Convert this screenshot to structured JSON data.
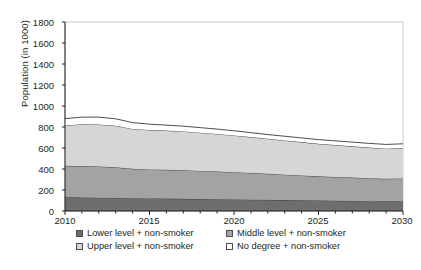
{
  "chart_data": {
    "type": "area",
    "stacked": true,
    "title": "",
    "xlabel": "",
    "ylabel": "Population (in 1000)",
    "xlim": [
      2010,
      2030
    ],
    "ylim": [
      0,
      1800
    ],
    "yticks": [
      0,
      200,
      400,
      600,
      800,
      1000,
      1200,
      1400,
      1600,
      1800
    ],
    "xticks": [
      2010,
      2015,
      2020,
      2025,
      2030
    ],
    "x_minor_tick_interval": 1,
    "grid": false,
    "legend_position": "bottom",
    "x": [
      2010,
      2011,
      2012,
      2013,
      2014,
      2015,
      2016,
      2017,
      2018,
      2019,
      2020,
      2021,
      2022,
      2023,
      2024,
      2025,
      2026,
      2027,
      2028,
      2029,
      2030
    ],
    "series": [
      {
        "name": "Lower level + non-smoker",
        "color": "#6e6e6e",
        "values": [
          130,
          128,
          126,
          124,
          122,
          120,
          118,
          116,
          114,
          112,
          110,
          108,
          106,
          104,
          102,
          100,
          98,
          96,
          94,
          92,
          90
        ]
      },
      {
        "name": "Middle level + non-smoker",
        "color": "#a3a3a3",
        "values": [
          300,
          300,
          298,
          292,
          280,
          276,
          274,
          272,
          268,
          264,
          260,
          254,
          248,
          242,
          236,
          230,
          226,
          222,
          218,
          214,
          220
        ]
      },
      {
        "name": "Upper level + non-smoker",
        "color": "#d6d6d6",
        "values": [
          385,
          398,
          400,
          396,
          380,
          376,
          374,
          370,
          364,
          358,
          350,
          342,
          334,
          326,
          318,
          310,
          304,
          298,
          292,
          288,
          290
        ]
      },
      {
        "name": "No degree + non-smoker",
        "color": "#ffffff",
        "values": [
          65,
          68,
          70,
          66,
          60,
          55,
          52,
          50,
          48,
          46,
          44,
          42,
          40,
          40,
          40,
          40,
          40,
          40,
          40,
          40,
          40
        ]
      }
    ],
    "cumulative_tops": {
      "lower": [
        130,
        128,
        126,
        124,
        122,
        120,
        118,
        116,
        114,
        112,
        110,
        108,
        106,
        104,
        102,
        100,
        98,
        96,
        94,
        92,
        90
      ],
      "lower_middle": [
        430,
        428,
        424,
        416,
        402,
        396,
        392,
        388,
        382,
        376,
        370,
        362,
        354,
        346,
        338,
        330,
        324,
        318,
        312,
        306,
        310
      ],
      "lower_middle_upper": [
        815,
        826,
        824,
        812,
        782,
        772,
        766,
        758,
        746,
        734,
        720,
        704,
        688,
        672,
        656,
        640,
        628,
        616,
        604,
        594,
        600
      ],
      "total": [
        880,
        894,
        894,
        878,
        842,
        827,
        818,
        808,
        794,
        780,
        764,
        746,
        728,
        712,
        696,
        680,
        668,
        656,
        644,
        634,
        640
      ]
    }
  },
  "axes": {
    "y_label": "Population (in 1000)",
    "y_tick_labels": [
      "1800",
      "1600",
      "1400",
      "1200",
      "1000",
      "800",
      "600",
      "400",
      "200",
      "0"
    ],
    "x_tick_labels": [
      "2010",
      "2015",
      "2020",
      "2025",
      "2030"
    ]
  },
  "legend": {
    "items": [
      {
        "label": "Lower level + non-smoker",
        "color": "#6e6e6e"
      },
      {
        "label": "Middle level + non-smoker",
        "color": "#a3a3a3"
      },
      {
        "label": "Upper level + non-smoker",
        "color": "#d6d6d6"
      },
      {
        "label": "No degree + non-smoker",
        "color": "#ffffff"
      }
    ]
  },
  "colors": {
    "axis": "#231f20",
    "frame": "#c9c9c9",
    "outline": "#3a3a3a",
    "background": "#ffffff"
  }
}
